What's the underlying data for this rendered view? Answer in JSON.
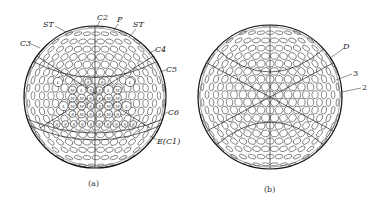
{
  "figure": {
    "panels": [
      {
        "id": "a",
        "caption": "(a)",
        "description": "Golf ball dimple pattern sphere with labeled construction lines",
        "labels": {
          "c2": "C2",
          "p": "P",
          "st_left": "ST",
          "st_right": "ST",
          "c3": "C3",
          "c4": "C4",
          "c5": "C5",
          "c6": "C6",
          "e_c1": "E(C1)"
        },
        "dimple_size_codes": [
          "L",
          "M",
          "S"
        ],
        "dimple_rows": [
          [
            "L",
            "S",
            "S",
            "L"
          ],
          [
            "M",
            "L",
            "S",
            "S",
            "L",
            "M"
          ],
          [
            "M",
            "M",
            "S",
            "S",
            "M",
            "M"
          ],
          [
            "L",
            "M",
            "M",
            "S",
            "S",
            "M",
            "M",
            "L"
          ],
          [
            "S",
            "M",
            "S",
            "S",
            "M",
            "S"
          ],
          [
            "S",
            "S",
            "S",
            "S",
            "S",
            "S",
            "S",
            "S",
            "S",
            "S"
          ]
        ]
      },
      {
        "id": "b",
        "caption": "(b)",
        "description": "Golf ball dimple pattern sphere, alternative layout",
        "labels": {
          "d": "D",
          "three": "3",
          "two": "2"
        }
      }
    ]
  }
}
